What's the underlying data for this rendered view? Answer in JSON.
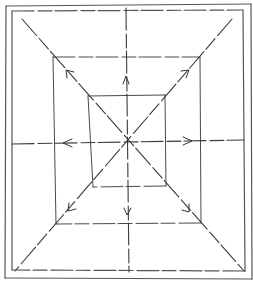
{
  "diagram": {
    "type": "line-drawing",
    "colors": {
      "stroke": "#3a3a3a",
      "background": "#ffffff"
    },
    "outer_frame": {
      "x1": 6,
      "y1": 5,
      "x2": 251,
      "y2": 279
    },
    "inner_frame": {
      "x1": 11,
      "y1": 11,
      "x2": 244,
      "y2": 271
    },
    "middle_rect": {
      "x1": 53,
      "y1": 57,
      "x2": 201,
      "y2": 223
    },
    "inner_rect": {
      "x1": 88,
      "y1": 95,
      "x2": 165,
      "y2": 187
    },
    "center": {
      "x": 126,
      "y": 143
    },
    "arrows": [
      {
        "name": "arrow-up-left",
        "at": [
          67,
          71
        ],
        "direction": "up-left"
      },
      {
        "name": "arrow-up",
        "at": [
          126,
          80
        ],
        "direction": "up"
      },
      {
        "name": "arrow-up-right",
        "at": [
          186,
          71
        ],
        "direction": "up-right"
      },
      {
        "name": "arrow-left",
        "at": [
          65,
          143
        ],
        "direction": "left"
      },
      {
        "name": "arrow-right",
        "at": [
          189,
          143
        ],
        "direction": "right"
      },
      {
        "name": "arrow-down-left",
        "at": [
          71,
          209
        ],
        "direction": "down-left"
      },
      {
        "name": "arrow-down",
        "at": [
          128,
          211
        ],
        "direction": "down"
      },
      {
        "name": "arrow-down-right",
        "at": [
          188,
          210
        ],
        "direction": "down-right"
      }
    ]
  }
}
